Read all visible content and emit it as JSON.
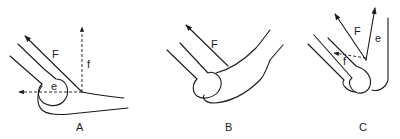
{
  "figure": {
    "panels": [
      {
        "id": "A",
        "label": "A",
        "force_labels": {
          "F": "F",
          "f": "f",
          "e": "e"
        }
      },
      {
        "id": "B",
        "label": "B",
        "force_labels": {
          "F": "F"
        }
      },
      {
        "id": "C",
        "label": "C",
        "force_labels": {
          "F": "F",
          "e": "e",
          "f": "f"
        }
      }
    ],
    "colors": {
      "line": "#1a1a1a",
      "background": "#ffffff"
    }
  }
}
